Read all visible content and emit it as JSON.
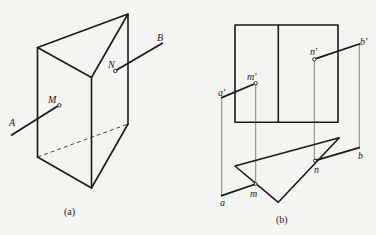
{
  "figure": {
    "panels": [
      {
        "id": "a",
        "caption": "(a)",
        "description": "Isometric view of triangular prism pierced by line AB at points M and N",
        "labels": {
          "A": "A",
          "B": "B",
          "M": "M",
          "N": "N"
        }
      },
      {
        "id": "b",
        "caption": "(b)",
        "description": "Orthographic projections (front and top views) of prism and line AB with piercing points",
        "labels": {
          "a_prime": "a'",
          "b_prime": "b'",
          "m_prime": "m'",
          "n_prime": "n'",
          "a": "a",
          "b": "b",
          "m": "m",
          "n": "n"
        }
      }
    ]
  }
}
